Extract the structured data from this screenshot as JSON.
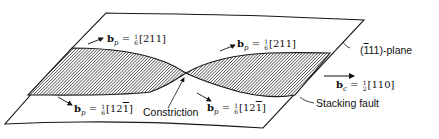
{
  "figure": {
    "type": "dislocation-constriction-diagram",
    "plane_label": "(ī11)-plane",
    "plane_label_parts": {
      "open": "(",
      "bar_index": "1",
      "rest": "11)-plane"
    },
    "stacking_fault_label": "Stacking fault",
    "constriction_label": "Constriction",
    "burgers_vectors": [
      {
        "id": "bp-upper-left",
        "symbol": "b",
        "sub": "p",
        "eq": " = ",
        "num": "1",
        "den": "6",
        "indices": "[211]"
      },
      {
        "id": "bp-upper-right",
        "symbol": "b",
        "sub": "p",
        "eq": " = ",
        "num": "1",
        "den": "6",
        "indices": "[211]"
      },
      {
        "id": "bp-lower-left",
        "symbol": "b",
        "sub": "p",
        "eq": " = ",
        "num": "1",
        "den": "6",
        "indices_pre": "[12",
        "indices_bar": "1",
        "indices_post": "]"
      },
      {
        "id": "bp-lower-right",
        "symbol": "b",
        "sub": "p",
        "eq": " = ",
        "num": "1",
        "den": "6",
        "indices_pre": "[12",
        "indices_bar": "1",
        "indices_post": "]"
      },
      {
        "id": "bc",
        "symbol": "b",
        "sub": "c",
        "eq": " = ",
        "num": "1",
        "den": "2",
        "indices": "[110]"
      }
    ],
    "colors": {
      "line": "#1a1a1a",
      "hatch": "#333333",
      "background": "#ffffff"
    }
  }
}
